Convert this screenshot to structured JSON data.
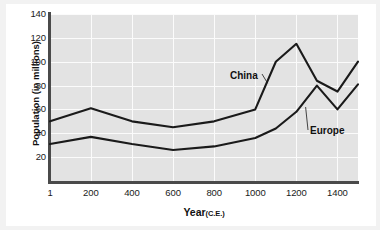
{
  "chart_data": {
    "type": "line",
    "title": "",
    "xlabel": "Year",
    "xlabel_suffix": "(C.E.)",
    "ylabel": "Population (in millions)",
    "xlim": [
      1,
      1500
    ],
    "ylim": [
      0,
      140
    ],
    "xticks": [
      1,
      200,
      400,
      600,
      800,
      1000,
      1200,
      1400
    ],
    "xticklabels": [
      "1",
      "200",
      "400",
      "600",
      "800",
      "1000",
      "1200",
      "1400"
    ],
    "yticks": [
      20,
      40,
      60,
      80,
      100,
      120,
      140
    ],
    "yticklabels": [
      "20",
      "40",
      "60",
      "80",
      "100",
      "120",
      "140"
    ],
    "grid": true,
    "grid_color": "#fbfbfb",
    "plot_background": "#e3e3e3",
    "page_background": "#f2f2f2",
    "legend_position": "inline-annotations",
    "x": [
      1,
      200,
      400,
      600,
      800,
      1000,
      1100,
      1200,
      1300,
      1400,
      1500
    ],
    "series": [
      {
        "name": "China",
        "color": "#1a1a1a",
        "values": [
          50,
          61,
          50,
          45,
          50,
          60,
          100,
          115,
          84,
          75,
          100
        ]
      },
      {
        "name": "Europe",
        "color": "#1a1a1a",
        "values": [
          31,
          37,
          31,
          26,
          29,
          36,
          44,
          58,
          80,
          60,
          81
        ]
      }
    ],
    "annotations": [
      {
        "text": "China",
        "target_x": 1060,
        "target_y": 82
      },
      {
        "text": "Europe",
        "target_x": 1245,
        "target_y": 62
      }
    ]
  }
}
